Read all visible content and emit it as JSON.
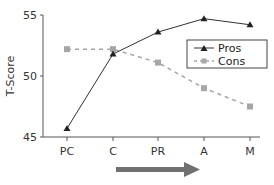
{
  "chart_data": {
    "type": "line",
    "title": "",
    "xlabel": "",
    "ylabel": "T-Score",
    "categories": [
      "PC",
      "C",
      "PR",
      "A",
      "M"
    ],
    "ylim": [
      45,
      55
    ],
    "yticks": [
      45,
      50,
      55
    ],
    "grid": false,
    "legend_position": "upper right (inside)",
    "series": [
      {
        "name": "Pros",
        "values": [
          45.7,
          51.8,
          53.6,
          54.7,
          54.2
        ],
        "color": "#333333",
        "line_style": "solid",
        "marker": "triangle"
      },
      {
        "name": "Cons",
        "values": [
          52.2,
          52.2,
          51.1,
          49.0,
          47.5
        ],
        "color": "#a6a6a6",
        "line_style": "dashed",
        "marker": "square"
      }
    ],
    "annotations": [
      {
        "type": "arrow",
        "direction": "right",
        "color": "#707070",
        "position": "below x-axis, from C to A"
      }
    ]
  },
  "labels": {
    "y_title": "T-Score",
    "y_ticks": [
      "45",
      "50",
      "55"
    ],
    "x_ticks": [
      "PC",
      "C",
      "PR",
      "A",
      "M"
    ],
    "legend": [
      "Pros",
      "Cons"
    ]
  }
}
